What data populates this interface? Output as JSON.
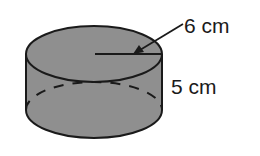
{
  "figure": {
    "shape": "cylinder",
    "fill_color": "#8f8f8f",
    "stroke_color": "#1a1a1a",
    "labels": {
      "radius": "6 cm",
      "height": "5 cm"
    }
  }
}
